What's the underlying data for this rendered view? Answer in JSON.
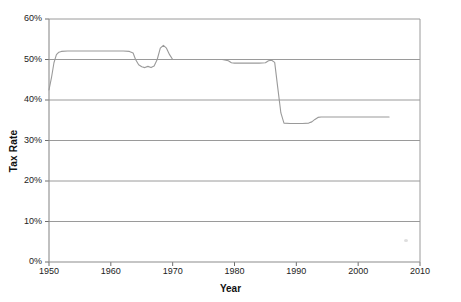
{
  "chart_data": {
    "type": "line",
    "title": "",
    "xlabel": "Year",
    "ylabel": "Tax Rate",
    "xlim": [
      1950,
      2010
    ],
    "ylim": [
      0,
      0.6
    ],
    "grid": true,
    "legend": null,
    "y_tick_labels": [
      "0%",
      "10%",
      "20%",
      "30%",
      "40%",
      "50%",
      "60%"
    ],
    "y_tick_values": [
      0,
      0.1,
      0.2,
      0.3,
      0.4,
      0.5,
      0.6
    ],
    "x_tick_labels": [
      "1950",
      "1960",
      "1970",
      "1980",
      "1990",
      "2000",
      "2010"
    ],
    "x_tick_values": [
      1950,
      1960,
      1970,
      1980,
      1990,
      2000,
      2010
    ],
    "series": [
      {
        "name": "Tax Rate",
        "color": "#9a9a9a",
        "x": [
          1950,
          1950.4,
          1950.8,
          1951.2,
          1951.6,
          1952,
          1953,
          1954,
          1955,
          1956,
          1957,
          1958,
          1959,
          1960,
          1961,
          1962,
          1963,
          1963.6,
          1964,
          1964.5,
          1965,
          1965.5,
          1966,
          1966.5,
          1967,
          1967.5,
          1968,
          1968.5,
          1969,
          1969.5,
          1970,
          1971,
          1972,
          1974,
          1976,
          1978,
          1979,
          1979.5,
          1980,
          1982,
          1984,
          1985,
          1985.5,
          1986,
          1986.5,
          1987,
          1987.5,
          1988,
          1989,
          1990,
          1991,
          1992,
          1992.5,
          1993,
          1993.5,
          1994,
          1996,
          1998,
          2000,
          2002,
          2004,
          2005
        ],
        "y": [
          0.425,
          0.455,
          0.492,
          0.512,
          0.518,
          0.52,
          0.521,
          0.521,
          0.521,
          0.521,
          0.521,
          0.521,
          0.521,
          0.521,
          0.521,
          0.521,
          0.52,
          0.516,
          0.5,
          0.487,
          0.482,
          0.48,
          0.483,
          0.48,
          0.484,
          0.5,
          0.528,
          0.535,
          0.528,
          0.512,
          0.5,
          0.5,
          0.5,
          0.5,
          0.5,
          0.5,
          0.497,
          0.492,
          0.491,
          0.491,
          0.491,
          0.492,
          0.497,
          0.498,
          0.493,
          0.43,
          0.368,
          0.343,
          0.342,
          0.342,
          0.342,
          0.343,
          0.346,
          0.352,
          0.357,
          0.358,
          0.358,
          0.358,
          0.358,
          0.358,
          0.358,
          0.358
        ]
      }
    ],
    "annotations": []
  },
  "axes": {
    "y_label": "Tax Rate",
    "x_label": "Year"
  }
}
